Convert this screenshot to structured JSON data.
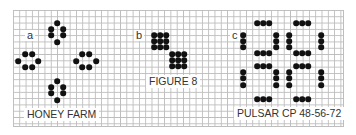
{
  "panels": [
    {
      "letter": "a",
      "caption": "HONEY FARM"
    },
    {
      "letter": "b",
      "caption": "FIGURE 8"
    },
    {
      "letter": "c",
      "caption": "PULSAR CP 48-56-72"
    }
  ],
  "colors": {
    "grid": "#bdbdbd",
    "dot": "#111111",
    "text": "#333333"
  },
  "cell_px": 6.3,
  "patterns": {
    "honey_farm": [
      [
        57,
        23
      ],
      [
        51,
        29
      ],
      [
        63,
        29
      ],
      [
        51,
        35
      ],
      [
        63,
        35
      ],
      [
        57,
        42
      ],
      [
        25,
        54
      ],
      [
        32,
        54
      ],
      [
        18,
        61
      ],
      [
        38,
        61
      ],
      [
        25,
        67
      ],
      [
        32,
        67
      ],
      [
        82,
        54
      ],
      [
        89,
        54
      ],
      [
        76,
        61
      ],
      [
        96,
        61
      ],
      [
        82,
        67
      ],
      [
        89,
        67
      ],
      [
        57,
        81
      ],
      [
        51,
        87
      ],
      [
        63,
        87
      ],
      [
        51,
        93
      ],
      [
        63,
        93
      ],
      [
        57,
        100
      ]
    ],
    "figure_8": [
      [
        154,
        35
      ],
      [
        160,
        35
      ],
      [
        166,
        35
      ],
      [
        154,
        41
      ],
      [
        160,
        41
      ],
      [
        166,
        41
      ],
      [
        154,
        47
      ],
      [
        160,
        47
      ],
      [
        166,
        47
      ],
      [
        172,
        54
      ],
      [
        178,
        54
      ],
      [
        184,
        54
      ],
      [
        172,
        60
      ],
      [
        178,
        60
      ],
      [
        184,
        60
      ],
      [
        172,
        66
      ],
      [
        178,
        66
      ],
      [
        184,
        66
      ]
    ],
    "pulsar": [
      [
        257,
        23
      ],
      [
        263,
        23
      ],
      [
        269,
        23
      ],
      [
        296,
        23
      ],
      [
        302,
        23
      ],
      [
        308,
        23
      ],
      [
        243,
        35
      ],
      [
        243,
        41
      ],
      [
        243,
        47
      ],
      [
        276,
        35
      ],
      [
        276,
        41
      ],
      [
        276,
        47
      ],
      [
        289,
        35
      ],
      [
        289,
        41
      ],
      [
        289,
        47
      ],
      [
        321,
        35
      ],
      [
        321,
        41
      ],
      [
        321,
        47
      ],
      [
        257,
        53
      ],
      [
        263,
        53
      ],
      [
        269,
        53
      ],
      [
        296,
        53
      ],
      [
        302,
        53
      ],
      [
        308,
        53
      ],
      [
        257,
        66
      ],
      [
        263,
        66
      ],
      [
        269,
        66
      ],
      [
        296,
        66
      ],
      [
        302,
        66
      ],
      [
        308,
        66
      ],
      [
        243,
        72
      ],
      [
        243,
        78
      ],
      [
        243,
        85
      ],
      [
        276,
        72
      ],
      [
        276,
        78
      ],
      [
        276,
        85
      ],
      [
        289,
        72
      ],
      [
        289,
        78
      ],
      [
        289,
        85
      ],
      [
        321,
        72
      ],
      [
        321,
        78
      ],
      [
        321,
        85
      ],
      [
        257,
        99
      ],
      [
        263,
        99
      ],
      [
        269,
        99
      ],
      [
        296,
        99
      ],
      [
        302,
        99
      ],
      [
        308,
        99
      ]
    ]
  }
}
